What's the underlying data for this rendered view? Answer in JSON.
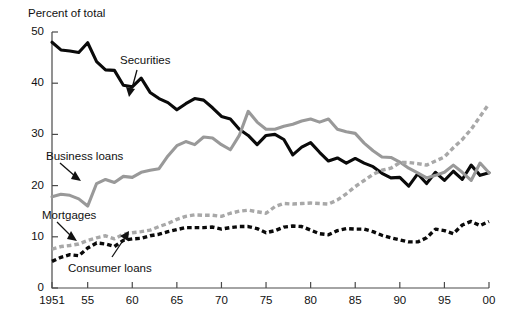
{
  "chart_data": {
    "type": "line",
    "title": "",
    "ylabel": "Percent of total",
    "xlabel": "",
    "ylim": [
      0,
      50
    ],
    "xlim": [
      1951,
      2000
    ],
    "yticks": [
      0,
      10,
      20,
      30,
      40,
      50
    ],
    "ytick_labels": [
      "0",
      "10",
      "20",
      "30",
      "40",
      "50"
    ],
    "xticks": [
      1951,
      1955,
      1960,
      1965,
      1970,
      1975,
      1980,
      1985,
      1990,
      1995,
      2000
    ],
    "xtick_labels": [
      "1951",
      "55",
      "60",
      "65",
      "70",
      "75",
      "80",
      "85",
      "90",
      "95",
      "00"
    ],
    "grid": false,
    "legend_position": "inline-annotations",
    "x": [
      1951,
      1952,
      1953,
      1954,
      1955,
      1956,
      1957,
      1958,
      1959,
      1960,
      1961,
      1962,
      1963,
      1964,
      1965,
      1966,
      1967,
      1968,
      1969,
      1970,
      1971,
      1972,
      1973,
      1974,
      1975,
      1976,
      1977,
      1978,
      1979,
      1980,
      1981,
      1982,
      1983,
      1984,
      1985,
      1986,
      1987,
      1988,
      1989,
      1990,
      1991,
      1992,
      1993,
      1994,
      1995,
      1996,
      1997,
      1998,
      1999,
      2000
    ],
    "series": [
      {
        "name": "Securities",
        "style": "solid",
        "color": "#0a0a0a",
        "values": [
          48.0,
          46.5,
          46.3,
          46.0,
          47.9,
          44.2,
          42.6,
          42.5,
          39.6,
          39.3,
          41.0,
          38.2,
          37.0,
          36.2,
          34.8,
          36.0,
          37.0,
          36.7,
          35.2,
          33.5,
          33.0,
          31.0,
          29.8,
          28.0,
          29.8,
          30.0,
          29.0,
          26.0,
          27.5,
          28.4,
          26.5,
          24.8,
          25.4,
          24.4,
          25.3,
          24.4,
          23.7,
          22.4,
          21.5,
          21.6,
          19.9,
          22.3,
          20.4,
          22.6,
          21.0,
          22.8,
          21.2,
          24.0,
          22.0,
          22.5
        ]
      },
      {
        "name": "Business loans",
        "style": "solid",
        "color": "#999999",
        "values": [
          17.8,
          18.3,
          18.1,
          17.4,
          16.0,
          20.4,
          21.2,
          20.6,
          21.8,
          21.6,
          22.6,
          23.0,
          23.3,
          25.8,
          27.8,
          28.6,
          28.0,
          29.5,
          29.3,
          28.0,
          27.0,
          29.8,
          34.5,
          32.4,
          31.0,
          31.0,
          31.6,
          32.0,
          32.6,
          33.0,
          32.4,
          33.0,
          31.0,
          30.5,
          30.2,
          28.3,
          26.8,
          25.6,
          25.5,
          24.6,
          23.4,
          22.5,
          21.5,
          22.0,
          22.6,
          24.0,
          22.6,
          21.0,
          24.4,
          22.5
        ]
      },
      {
        "name": "Mortgages",
        "style": "dashed",
        "color": "#a8a8a8",
        "values": [
          7.6,
          8.1,
          8.3,
          8.6,
          9.3,
          9.8,
          10.2,
          9.6,
          10.5,
          10.8,
          11.0,
          11.3,
          12.0,
          12.6,
          13.4,
          14.0,
          14.3,
          14.2,
          14.2,
          14.0,
          14.6,
          15.0,
          15.2,
          14.9,
          14.6,
          15.9,
          16.5,
          16.4,
          16.5,
          16.6,
          16.5,
          16.4,
          17.2,
          18.4,
          19.8,
          21.0,
          22.2,
          23.0,
          23.4,
          24.5,
          24.5,
          24.3,
          24.0,
          24.8,
          25.6,
          27.4,
          29.0,
          31.0,
          33.5,
          36.0
        ]
      },
      {
        "name": "Consumer loans",
        "style": "dashed",
        "color": "#0a0a0a",
        "values": [
          5.2,
          6.0,
          6.5,
          6.3,
          7.8,
          8.8,
          8.6,
          8.1,
          9.3,
          9.6,
          9.7,
          10.2,
          10.5,
          11.0,
          11.4,
          11.8,
          11.8,
          11.8,
          11.9,
          11.5,
          11.8,
          12.0,
          12.0,
          11.6,
          10.8,
          11.2,
          11.9,
          12.1,
          12.0,
          11.3,
          10.6,
          10.4,
          11.2,
          11.6,
          11.5,
          11.5,
          11.0,
          10.3,
          9.8,
          9.4,
          9.0,
          9.0,
          9.8,
          11.5,
          11.2,
          10.6,
          12.3,
          13.0,
          12.2,
          13.0
        ]
      }
    ],
    "annotations": [
      {
        "text": "Securities",
        "points_to": "securities-line"
      },
      {
        "text": "Business loans",
        "points_to": "business-loans-line"
      },
      {
        "text": "Mortgages",
        "points_to": "mortgages-line"
      },
      {
        "text": "Consumer loans",
        "points_to": "consumer-loans-line"
      }
    ]
  }
}
